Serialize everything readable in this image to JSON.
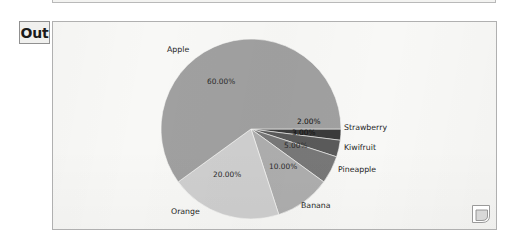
{
  "cell": {
    "label": "Out",
    "background_color": "#f8f8f6",
    "border_color": "#b0b0b0"
  },
  "bracket": {
    "name": "cell-bracket-page-curl"
  },
  "chart_data": {
    "type": "pie",
    "title": "",
    "categories": [
      "Strawberry",
      "Kiwifruit",
      "Pineapple",
      "Banana",
      "Orange",
      "Apple"
    ],
    "values": [
      2,
      3,
      5,
      10,
      20,
      60
    ],
    "value_labels": [
      "2.00%",
      "3.00%",
      "5.00%",
      "10.00%",
      "20.00%",
      "60.00%"
    ],
    "colors": [
      "#3b3b3b",
      "#5a5a5a",
      "#787878",
      "#aeaeae",
      "#cfcfcf",
      "#a0a0a0"
    ],
    "start_angle_deg": 0,
    "direction": "clockwise",
    "legend": "none",
    "grid": false,
    "slices": [
      {
        "name": "Strawberry",
        "value": 2,
        "value_label": "2.00%",
        "color": "#3b3b3b",
        "label_x": 296,
        "label_y": 117,
        "name_x": 343,
        "name_y": 123,
        "on_dark": true
      },
      {
        "name": "Kiwifruit",
        "value": 3,
        "value_label": "3.00%",
        "color": "#5a5a5a",
        "label_x": 291,
        "label_y": 128,
        "name_x": 343,
        "name_y": 143,
        "on_dark": true
      },
      {
        "name": "Pineapple",
        "value": 5,
        "value_label": "5.00%",
        "color": "#787878",
        "label_x": 283,
        "label_y": 141,
        "name_x": 337,
        "name_y": 165,
        "on_dark": false
      },
      {
        "name": "Banana",
        "value": 10,
        "value_label": "10.00%",
        "color": "#aeaeae",
        "label_x": 268,
        "label_y": 162,
        "name_x": 300,
        "name_y": 201,
        "on_dark": false
      },
      {
        "name": "Orange",
        "value": 20,
        "value_label": "20.00%",
        "color": "#cfcfcf",
        "label_x": 212,
        "label_y": 170,
        "name_x": 170,
        "name_y": 207,
        "on_dark": false
      },
      {
        "name": "Apple",
        "value": 60,
        "value_label": "60.00%",
        "color": "#a0a0a0",
        "label_x": 206,
        "label_y": 77,
        "name_x": 166,
        "name_y": 45,
        "on_dark": false
      }
    ],
    "geometry": {
      "center_x": 250,
      "center_y": 128,
      "radius": 90
    }
  }
}
